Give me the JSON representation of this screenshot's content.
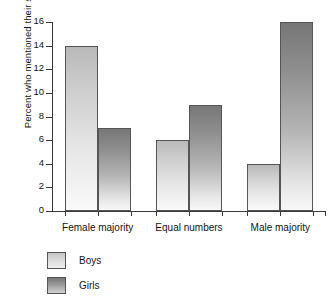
{
  "chart_data": {
    "type": "bar",
    "title": "",
    "xlabel": "",
    "ylabel": "Percent who mentioned their sex",
    "categories": [
      "Female majority",
      "Equal numbers",
      "Male majority"
    ],
    "series": [
      {
        "name": "Boys",
        "values": [
          14,
          6,
          4
        ],
        "color": "#d4d4d4"
      },
      {
        "name": "Girls",
        "values": [
          7,
          9,
          16
        ],
        "color": "#8a8a8a"
      }
    ],
    "ylim": [
      0,
      16
    ],
    "ytick_step": 2,
    "yticks": [
      0,
      2,
      4,
      6,
      8,
      10,
      12,
      14,
      16
    ],
    "ytick_labels": [
      "0",
      "2",
      "4",
      "6",
      "8",
      "10",
      "12",
      "14",
      "16"
    ],
    "grid": false,
    "legend_position": "bottom-left",
    "legend_entries": [
      "Boys",
      "Girls"
    ]
  }
}
